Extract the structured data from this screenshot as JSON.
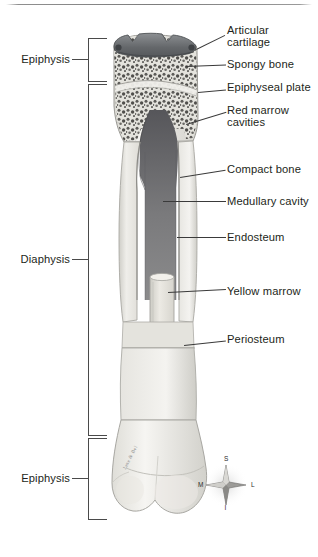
{
  "figure": {
    "orientation_key": {
      "superior": "S",
      "inferior": "I",
      "medial": "M",
      "lateral": "L"
    },
    "artist_signature": "Jane & Bel"
  },
  "region_brackets": [
    {
      "id": "epiphysis-proximal",
      "label": "Epiphysis"
    },
    {
      "id": "diaphysis",
      "label": "Diaphysis"
    },
    {
      "id": "epiphysis-distal",
      "label": "Epiphysis"
    }
  ],
  "callouts": [
    {
      "id": "articular-cartilage",
      "label": "Articular\ncartilage"
    },
    {
      "id": "spongy-bone",
      "label": "Spongy bone"
    },
    {
      "id": "epiphyseal-plate",
      "label": "Epiphyseal plate"
    },
    {
      "id": "red-marrow-cavities",
      "label": "Red marrow\ncavities"
    },
    {
      "id": "compact-bone",
      "label": "Compact bone"
    },
    {
      "id": "medullary-cavity",
      "label": "Medullary cavity"
    },
    {
      "id": "endosteum",
      "label": "Endosteum"
    },
    {
      "id": "yellow-marrow",
      "label": "Yellow marrow"
    },
    {
      "id": "periosteum",
      "label": "Periosteum"
    }
  ],
  "colors": {
    "ink": "#231f20",
    "leader": "#3a3a3a",
    "bracket": "#4a4a4a",
    "cartilage": "#6e7174",
    "compact_bone": "#e9e9e6",
    "spongy_bone": "#d9d8d2",
    "medullary_cavity": "#6f6f70",
    "yellow_marrow": "#dcdbd4",
    "periosteum": "#c9c8c2",
    "background": "#ffffff"
  }
}
